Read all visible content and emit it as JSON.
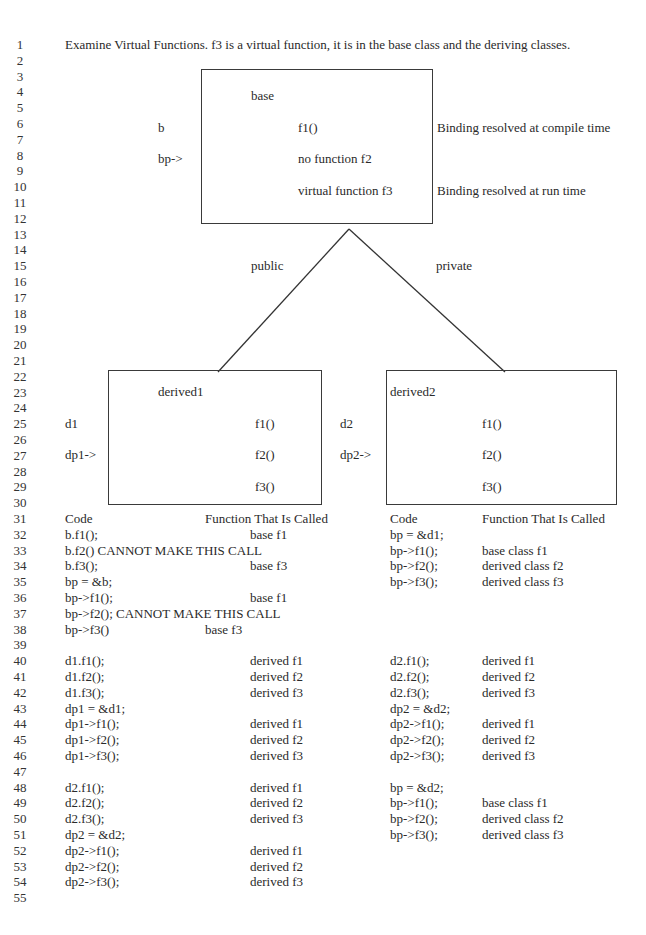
{
  "line_numbers": [
    "1",
    "2",
    "3",
    "4",
    "5",
    "6",
    "7",
    "8",
    "9",
    "10",
    "11",
    "12",
    "13",
    "14",
    "15",
    "16",
    "17",
    "18",
    "19",
    "20",
    "21",
    "22",
    "23",
    "24",
    "25",
    "26",
    "27",
    "28",
    "29",
    "30",
    "31",
    "32",
    "33",
    "34",
    "35",
    "36",
    "37",
    "38",
    "39",
    "40",
    "41",
    "42",
    "43",
    "44",
    "45",
    "46",
    "47",
    "48",
    "49",
    "50",
    "51",
    "52",
    "53",
    "54",
    "55"
  ],
  "title": "Examine Virtual Functions.  f3 is a virtual function, it is in the base class and the deriving classes.",
  "diagram": {
    "base_box": {
      "name": "base",
      "f1": "f1()",
      "f2": "no function f2",
      "f3": "virtual function f3"
    },
    "base_labels": {
      "object": "b",
      "pointer": "bp->",
      "compile_note": "Binding resolved at compile time",
      "runtime_note": "Binding resolved at run time"
    },
    "inheritance": {
      "left": "public",
      "right": "private"
    },
    "derived1_box": {
      "name": "derived1",
      "f1": "f1()",
      "f2": "f2()",
      "f3": "f3()",
      "object": "d1",
      "pointer": "dp1->"
    },
    "derived2_box": {
      "name": "derived2",
      "f1": "f1()",
      "f2": "f2()",
      "f3": "f3()",
      "object": "d2",
      "pointer": "dp2->"
    }
  },
  "left_table": {
    "header": {
      "code": "Code",
      "func": "Function That Is Called"
    },
    "rows": [
      {
        "code": "b.f1();",
        "func": "base f1"
      },
      {
        "code": "b.f2() CANNOT MAKE THIS CALL",
        "func": ""
      },
      {
        "code": "b.f3();",
        "func": "base f3"
      },
      {
        "code": "bp = &b;",
        "func": ""
      },
      {
        "code": "bp->f1();",
        "func": "base f1"
      },
      {
        "code": "bp->f2(); CANNOT MAKE THIS CALL",
        "func": ""
      },
      {
        "code": "bp->f3()",
        "func": "base f3"
      },
      {
        "code": "",
        "func": ""
      },
      {
        "code": "d1.f1();",
        "func": "derived f1"
      },
      {
        "code": "d1.f2();",
        "func": "derived f2"
      },
      {
        "code": "d1.f3();",
        "func": "derived f3"
      },
      {
        "code": "dp1 = &d1;",
        "func": ""
      },
      {
        "code": "dp1->f1();",
        "func": "derived f1"
      },
      {
        "code": "dp1->f2();",
        "func": "derived f2"
      },
      {
        "code": "dp1->f3();",
        "func": "derived f3"
      },
      {
        "code": "",
        "func": ""
      },
      {
        "code": "d2.f1();",
        "func": "derived f1"
      },
      {
        "code": "d2.f2();",
        "func": "derived f2"
      },
      {
        "code": "d2.f3();",
        "func": "derived f3"
      },
      {
        "code": "dp2 = &d2;",
        "func": ""
      },
      {
        "code": "dp2->f1();",
        "func": "derived f1"
      },
      {
        "code": "dp2->f2();",
        "func": "derived f2"
      },
      {
        "code": "dp2->f3();",
        "func": "derived f3"
      }
    ]
  },
  "right_table": {
    "header": {
      "code": "Code",
      "func": "Function That Is Called"
    },
    "rows": [
      {
        "code": "bp = &d1;",
        "func": ""
      },
      {
        "code": "bp->f1();",
        "func": "base class f1"
      },
      {
        "code": "bp->f2();",
        "func": "derived class f2"
      },
      {
        "code": "bp->f3();",
        "func": "derived class f3"
      },
      {
        "code": "",
        "func": ""
      },
      {
        "code": "",
        "func": ""
      },
      {
        "code": "",
        "func": ""
      },
      {
        "code": "",
        "func": ""
      },
      {
        "code": "d2.f1();",
        "func": "derived f1"
      },
      {
        "code": "d2.f2();",
        "func": "derived f2"
      },
      {
        "code": "d2.f3();",
        "func": "derived f3"
      },
      {
        "code": "dp2 = &d2;",
        "func": ""
      },
      {
        "code": "dp2->f1();",
        "func": "derived f1"
      },
      {
        "code": "dp2->f2();",
        "func": "derived f2"
      },
      {
        "code": "dp2->f3();",
        "func": "derived f3"
      },
      {
        "code": "",
        "func": ""
      },
      {
        "code": "bp = &d2;",
        "func": ""
      },
      {
        "code": "bp->f1();",
        "func": "base class f1"
      },
      {
        "code": "bp->f2();",
        "func": "derived class f2"
      },
      {
        "code": "bp->f3();",
        "func": "derived class f3"
      }
    ]
  }
}
